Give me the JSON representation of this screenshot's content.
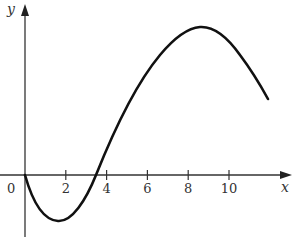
{
  "chart_data": {
    "type": "line",
    "title": "",
    "xlabel": "x",
    "ylabel": "y",
    "origin_label": "0",
    "x_ticks": [
      2,
      4,
      6,
      8,
      10
    ],
    "x_tick_labels": [
      "2",
      "4",
      "6",
      "8",
      "10"
    ],
    "xlim": [
      0,
      12.8
    ],
    "grid": false,
    "legend": null,
    "series": [
      {
        "name": "curve",
        "x": [
          0,
          0.5,
          1,
          1.6,
          2,
          2.5,
          3,
          3.5,
          4,
          5,
          6,
          7,
          8,
          8.6,
          9,
          10,
          11,
          11.9
        ],
        "y": [
          0,
          -1.5,
          -2.3,
          -2.6,
          -2.45,
          -1.9,
          -1.0,
          0,
          1.2,
          3.7,
          6.0,
          7.8,
          8.9,
          9.1,
          9.0,
          8.0,
          6.2,
          4.5
        ]
      }
    ],
    "annotations": {
      "zero_crossing_x": 3.5,
      "local_min_x": 1.6,
      "local_max_x": 8.6
    }
  }
}
